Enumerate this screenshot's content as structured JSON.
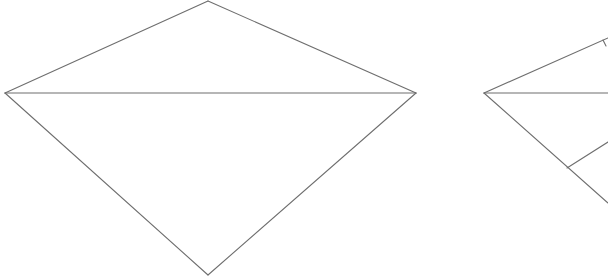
{
  "canvas": {
    "width": 608,
    "height": 277,
    "background": "#ffffff",
    "stroke_color": "#6e6e6e"
  },
  "figures": [
    {
      "name": "kite-left",
      "vertices": {
        "top": [
          208,
          1
        ],
        "left": [
          5,
          93
        ],
        "right": [
          416,
          93
        ],
        "bottom": [
          208,
          275
        ]
      },
      "segments": [
        [
          5,
          93,
          208,
          1
        ],
        [
          208,
          1,
          416,
          93
        ],
        [
          5,
          93,
          416,
          93
        ],
        [
          5,
          93,
          208,
          275
        ],
        [
          208,
          275,
          416,
          93
        ]
      ]
    },
    {
      "name": "kite-right-partial",
      "vertices": {
        "left": [
          484,
          93
        ]
      },
      "segments": [
        [
          484,
          93,
          608,
          38
        ],
        [
          603,
          40,
          606,
          46
        ],
        [
          484,
          93,
          608,
          93
        ],
        [
          484,
          93,
          608,
          203
        ],
        [
          567,
          168,
          608,
          142
        ]
      ]
    }
  ]
}
